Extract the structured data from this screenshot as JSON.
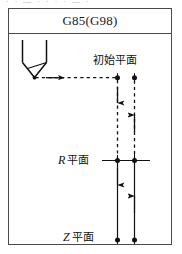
{
  "figure": {
    "title": "G85(G98)",
    "scan_artifact_text": "· · — · ·  · · — ·",
    "labels": {
      "initial_plane": "初始平面",
      "r_plane_symbol": "R",
      "r_plane": "平面",
      "z_plane_symbol": "Z",
      "z_plane": "平面"
    },
    "tool": {
      "name": "boring-tool"
    },
    "colors": {
      "line": "#1a1a1a",
      "frame": "#4a4a4a",
      "background": "#ffffff"
    },
    "paths": {
      "rapid_in_label": "rapid-traverse-to-initial-plane",
      "down_to_r_label": "rapid-down-to-r-plane",
      "feed_down_label": "feed-down-to-z-plane",
      "feed_up_label": "feed-up-to-r-plane",
      "retract_label": "retract-to-initial-plane"
    }
  }
}
